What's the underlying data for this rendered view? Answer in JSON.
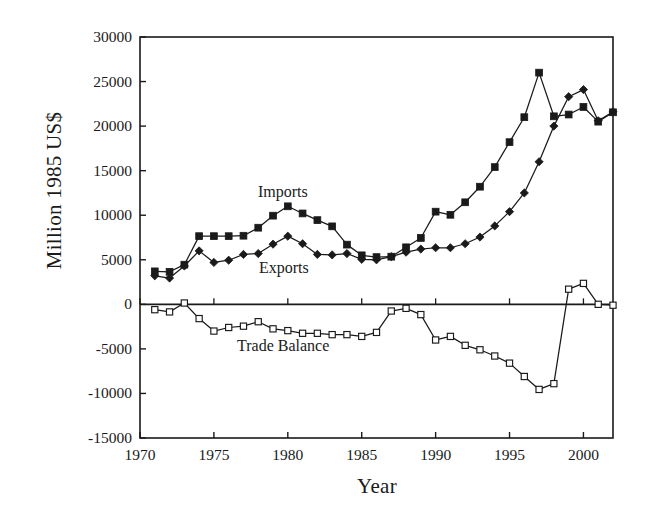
{
  "chart_data": {
    "type": "line",
    "title": "",
    "xlabel": "Year",
    "ylabel": "Million 1985 US$",
    "xlim": [
      1970,
      2002
    ],
    "ylim": [
      -15000,
      30000
    ],
    "grid": false,
    "legend_position": "inline-annotations",
    "x_ticks": [
      "1970",
      "1975",
      "1980",
      "1985",
      "1990",
      "1995",
      "2000"
    ],
    "x_tick_values": [
      1970,
      1975,
      1980,
      1985,
      1990,
      1995,
      2000
    ],
    "y_ticks": [
      "30000",
      "25000",
      "20000",
      "15000",
      "10000",
      "5000",
      "0",
      "-5000",
      "-10000",
      "-15000"
    ],
    "y_tick_values": [
      30000,
      25000,
      20000,
      15000,
      10000,
      5000,
      0,
      -5000,
      -10000,
      -15000
    ],
    "x": [
      1971,
      1972,
      1973,
      1974,
      1975,
      1976,
      1977,
      1978,
      1979,
      1980,
      1981,
      1982,
      1983,
      1984,
      1985,
      1986,
      1987,
      1988,
      1989,
      1990,
      1991,
      1992,
      1993,
      1994,
      1995,
      1996,
      1997,
      1998,
      1999,
      2000,
      2001,
      2002
    ],
    "series": [
      {
        "name": "Imports",
        "marker": "filled-square",
        "values": [
          3700,
          3650,
          4450,
          7650,
          7650,
          7650,
          7700,
          8600,
          9950,
          11000,
          10200,
          9450,
          8750,
          6700,
          5500,
          5300,
          5350,
          6400,
          7450,
          10400,
          10050,
          11450,
          13200,
          15400,
          18200,
          21000,
          26000,
          21100,
          21300,
          22150,
          20500,
          21550
        ]
      },
      {
        "name": "Exports",
        "marker": "filled-diamond",
        "values": [
          3200,
          2950,
          4300,
          6000,
          4700,
          4950,
          5600,
          5700,
          6750,
          7650,
          6800,
          5600,
          5550,
          5700,
          5050,
          5000,
          5350,
          5850,
          6200,
          6350,
          6350,
          6800,
          7550,
          8800,
          10400,
          12500,
          16000,
          20000,
          23300,
          24100,
          20600,
          21600
        ]
      },
      {
        "name": "Trade Balance",
        "marker": "open-square",
        "values": [
          -600,
          -850,
          150,
          -1600,
          -3000,
          -2600,
          -2450,
          -1950,
          -2750,
          -2950,
          -3250,
          -3250,
          -3400,
          -3400,
          -3600,
          -3150,
          -750,
          -450,
          -1150,
          -4000,
          -3600,
          -4600,
          -5100,
          -5800,
          -6600,
          -8100,
          -9550,
          -8900,
          1700,
          2350,
          0,
          -100
        ]
      }
    ]
  },
  "axes": {
    "ylabel": "Million 1985 US$",
    "xlabel": "Year"
  },
  "annotations": [
    {
      "name": "imports",
      "text": "Imports"
    },
    {
      "name": "exports",
      "text": "Exports"
    },
    {
      "name": "trade-balance",
      "text": "Trade Balance"
    }
  ]
}
